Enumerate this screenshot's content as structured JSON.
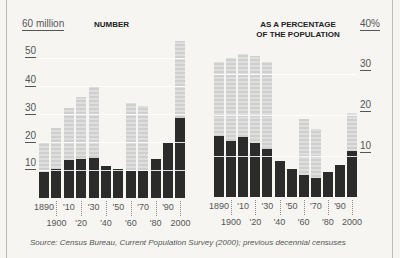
{
  "chart_data": [
    {
      "type": "bar",
      "title": "NUMBER",
      "ylabel": "millions",
      "yaxis_top_label": "60 million",
      "ylim": [
        0,
        60
      ],
      "yticks": [
        10,
        20,
        30,
        40,
        50,
        60
      ],
      "categories": [
        "1890",
        "1900",
        "1910",
        "1920",
        "1930",
        "1940",
        "1950",
        "1960",
        "1970",
        "1980",
        "1990",
        "2000"
      ],
      "x_tick_labels_row1": [
        "1890",
        "'10",
        "'30",
        "'50",
        "'70",
        "'90"
      ],
      "x_tick_labels_row2": [
        "1900",
        "'20",
        "'40",
        "'60",
        "'80",
        "2000"
      ],
      "series": [
        {
          "name": "Total (light)",
          "values": [
            20,
            25,
            32,
            36,
            40,
            null,
            null,
            34,
            33,
            null,
            null,
            56
          ]
        },
        {
          "name": "Foreign-born (dark)",
          "values": [
            9.2,
            10.3,
            13.5,
            13.9,
            14.2,
            11.6,
            10.3,
            9.7,
            9.6,
            14.1,
            19.8,
            28.4
          ]
        }
      ],
      "grid": true
    },
    {
      "type": "bar",
      "title": "AS A PERCENTAGE OF THE POPULATION",
      "ylabel": "percent",
      "yaxis_top_label": "40%",
      "ylim": [
        0,
        40
      ],
      "yticks": [
        10,
        20,
        30,
        40
      ],
      "categories": [
        "1890",
        "1900",
        "1910",
        "1920",
        "1930",
        "1940",
        "1950",
        "1960",
        "1970",
        "1980",
        "1990",
        "2000"
      ],
      "x_tick_labels_row1": [
        "1890",
        "'10",
        "'30",
        "'50",
        "'70",
        "'90"
      ],
      "x_tick_labels_row2": [
        "1900",
        "'20",
        "'40",
        "'60",
        "'80",
        "2000"
      ],
      "series": [
        {
          "name": "Total (light)",
          "values": [
            33,
            34,
            35,
            34.5,
            33,
            null,
            null,
            19,
            16.5,
            null,
            null,
            20.5
          ]
        },
        {
          "name": "Foreign-born (dark)",
          "values": [
            14.8,
            13.6,
            14.7,
            13.2,
            11.6,
            8.8,
            6.9,
            5.4,
            4.7,
            6.2,
            7.9,
            11.1
          ]
        }
      ],
      "grid": true
    }
  ],
  "labels": {
    "left_title": "NUMBER",
    "left_top": "60 million",
    "left_ticks": [
      "50",
      "40",
      "30",
      "20",
      "10"
    ],
    "right_title_1": "AS A PERCENTAGE",
    "right_title_2": "OF THE POPULATION",
    "right_top": "40%",
    "right_ticks": [
      "30",
      "20",
      "10"
    ],
    "row1": [
      "1890",
      "'10",
      "'30",
      "'50",
      "'70",
      "'90"
    ],
    "row2": [
      "1900",
      "'20",
      "'40",
      "'60",
      "'80",
      "2000"
    ],
    "source": "Source: Census Bureau, Current Population Survey (2000); previous decennial censuses"
  }
}
